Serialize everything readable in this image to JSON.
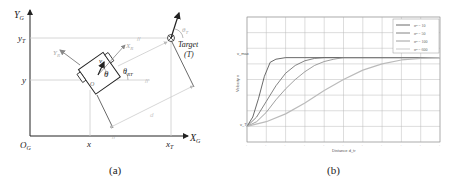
{
  "figure": {
    "panel_a": {
      "caption": "(a)",
      "axes": {
        "y_axis_label": "Y",
        "y_axis_sub": "G",
        "x_axis_label": "X",
        "x_axis_sub": "G",
        "origin_label": "O",
        "origin_sub": "G"
      },
      "tick_labels": {
        "y_target": "y",
        "y_target_sub": "T",
        "y_robot": "y",
        "x_robot": "x",
        "x_target": "x",
        "x_target_sub": "T"
      },
      "robot": {
        "frame_x_label": "X",
        "frame_x_sub": "R",
        "frame_y_label": "Y",
        "frame_y_sub": "R",
        "velocity_label": "v",
        "heading_label": "θ",
        "bearing_label": "θ",
        "bearing_sub": "RT",
        "center_label": "O"
      },
      "target": {
        "label": "Target",
        "abbrev": "(T)",
        "heading_label": "θ",
        "heading_sub": "T"
      },
      "distance_label": "d"
    },
    "panel_b": {
      "caption": "(b)"
    }
  },
  "chart_data": {
    "type": "line",
    "title": "",
    "xlabel": "Distance d_tr",
    "ylabel": "Velocity v",
    "y_tick_labels": [
      "v_T",
      "v_max"
    ],
    "x_ticks_count": 11,
    "grid": true,
    "legend_position": "upper right",
    "xlim": [
      0,
      10
    ],
    "ylim": [
      -1,
      7
    ],
    "series": [
      {
        "name": "σ² = 10",
        "color": "#444444",
        "x": [
          0,
          0.3,
          0.6,
          0.9,
          1.2,
          1.5,
          2,
          3,
          4,
          5,
          6,
          7,
          8,
          9,
          10
        ],
        "values": [
          0,
          0.6,
          1.8,
          3.2,
          4.1,
          4.3,
          4.4,
          4.4,
          4.4,
          4.4,
          4.4,
          4.4,
          4.4,
          4.4,
          4.4
        ]
      },
      {
        "name": "σ² = 50",
        "color": "#666666",
        "x": [
          0,
          0.5,
          1,
          1.5,
          2,
          2.5,
          3,
          3.5,
          4,
          5,
          6,
          7,
          8,
          9,
          10
        ],
        "values": [
          0,
          0.6,
          1.6,
          2.6,
          3.4,
          3.9,
          4.2,
          4.35,
          4.4,
          4.4,
          4.4,
          4.4,
          4.4,
          4.4,
          4.4
        ]
      },
      {
        "name": "σ² = 100",
        "color": "#888888",
        "x": [
          0,
          0.5,
          1,
          1.5,
          2,
          2.5,
          3,
          3.5,
          4,
          4.5,
          5,
          6,
          7,
          8,
          10
        ],
        "values": [
          0,
          0.3,
          0.9,
          1.7,
          2.4,
          3.0,
          3.5,
          3.9,
          4.15,
          4.3,
          4.4,
          4.4,
          4.4,
          4.4,
          4.4
        ]
      },
      {
        "name": "σ² = 600",
        "color": "#bbbbbb",
        "x": [
          0,
          1,
          2,
          3,
          4,
          5,
          6,
          7,
          8,
          9,
          10
        ],
        "values": [
          0,
          0.3,
          0.8,
          1.5,
          2.3,
          3.0,
          3.6,
          4.0,
          4.25,
          4.35,
          4.4
        ]
      }
    ]
  }
}
